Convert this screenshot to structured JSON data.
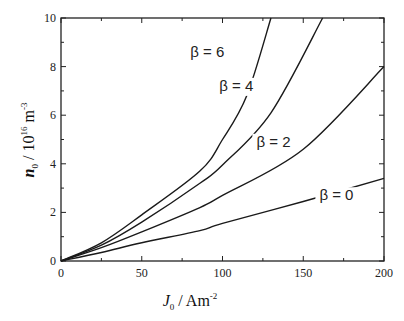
{
  "chart_data": {
    "type": "line",
    "title": "",
    "xlabel": "J0 / Am^-2",
    "ylabel": "n0 / 10^16 m^-3",
    "xlabel_parts": {
      "main": "J",
      "sub": "0",
      "unit": " / Am",
      "sup": "-2"
    },
    "ylabel_parts": {
      "main": "n",
      "sub": "0",
      "unit": " / 10",
      "sup1": "16",
      "unit2": " m",
      "sup2": "-3"
    },
    "xlim": [
      0,
      200
    ],
    "ylim": [
      0,
      10
    ],
    "x_ticks": [
      0,
      50,
      100,
      150,
      200
    ],
    "y_ticks": [
      0,
      2,
      4,
      6,
      8,
      10
    ],
    "grid": false,
    "legend": "inline labels",
    "series": [
      {
        "name": "β = 0",
        "x": [
          0,
          25,
          50,
          86,
          100,
          150,
          200
        ],
        "values": [
          0,
          0.35,
          0.75,
          1.25,
          1.55,
          2.45,
          3.4
        ],
        "label_pos": {
          "x": 160,
          "y": 2.5
        }
      },
      {
        "name": "β = 2",
        "x": [
          0,
          25,
          50,
          86,
          100,
          150,
          200
        ],
        "values": [
          0,
          0.55,
          1.2,
          2.2,
          2.7,
          4.6,
          8.0
        ],
        "label_pos": {
          "x": 121,
          "y": 4.7
        }
      },
      {
        "name": "β = 4",
        "x": [
          0,
          25,
          50,
          86,
          100,
          130,
          162
        ],
        "values": [
          0,
          0.65,
          1.6,
          3.2,
          3.95,
          6.1,
          10.0
        ],
        "label_pos": {
          "x": 98,
          "y": 7.0
        }
      },
      {
        "name": "β = 6",
        "x": [
          0,
          25,
          50,
          86,
          100,
          115,
          130
        ],
        "values": [
          0,
          0.75,
          1.9,
          3.7,
          5.0,
          6.8,
          10.0
        ],
        "label_pos": {
          "x": 80,
          "y": 8.4
        }
      }
    ]
  }
}
